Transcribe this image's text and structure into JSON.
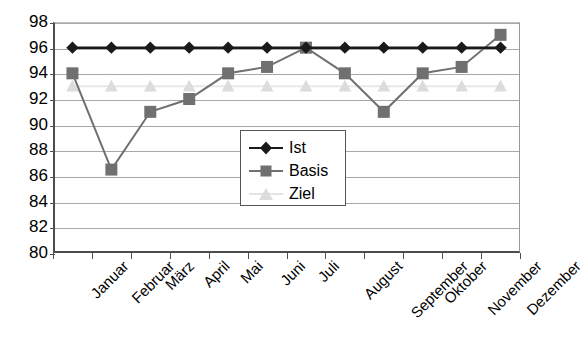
{
  "chart_data": {
    "type": "line",
    "title": "",
    "xlabel": "",
    "ylabel": "",
    "ylim": [
      80,
      98
    ],
    "ytick_step": 2,
    "yticks": [
      98,
      96,
      94,
      92,
      90,
      88,
      86,
      84,
      82,
      80
    ],
    "grid": true,
    "legend_position": "inside-center-left",
    "categories": [
      "Januar",
      "Februar",
      "März",
      "April",
      "Mai",
      "Juni",
      "Juli",
      "August",
      "September",
      "Oktober",
      "November",
      "Dezember"
    ],
    "series": [
      {
        "name": "Ist",
        "marker": "diamond",
        "color": "#1a1a1a",
        "values": [
          96,
          96,
          96,
          96,
          96,
          96,
          96,
          96,
          96,
          96,
          96,
          96
        ]
      },
      {
        "name": "Basis",
        "marker": "square",
        "color": "#707070",
        "values": [
          94,
          86.5,
          91,
          92,
          94,
          94.5,
          96,
          94,
          91,
          94,
          94.5,
          97
        ]
      },
      {
        "name": "Ziel",
        "marker": "triangle",
        "color": "#dcdcdc",
        "values": [
          93,
          93,
          93,
          93,
          93,
          93,
          93,
          93,
          93,
          93,
          93,
          93
        ]
      }
    ]
  },
  "legend": {
    "entries": [
      {
        "label": "Ist"
      },
      {
        "label": "Basis"
      },
      {
        "label": "Ziel"
      }
    ]
  },
  "colors": {
    "ist": "#1a1a1a",
    "basis": "#707070",
    "ziel": "#dcdcdc",
    "gridline": "#a8a8a8",
    "axis": "#4d4d4d",
    "background": "#ffffff"
  }
}
